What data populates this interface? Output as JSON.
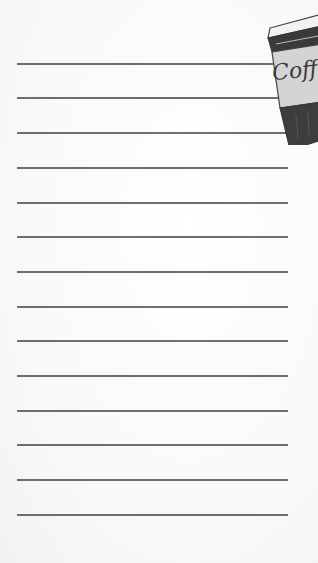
{
  "page": {
    "type": "lined-notepad",
    "background_color": "#fbfbfb",
    "line_color": "#6e6e6e",
    "line_count": 14,
    "line_positions_y": [
      63,
      97,
      132,
      167,
      202,
      236,
      271,
      306,
      340,
      375,
      410,
      444,
      479,
      514
    ]
  },
  "illustration": {
    "subject": "coffee-cup-icon",
    "label_text": "Coff"
  }
}
